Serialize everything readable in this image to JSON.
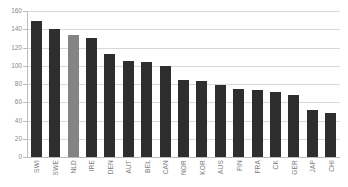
{
  "chart_data": {
    "type": "bar",
    "title": "",
    "xlabel": "",
    "ylabel": "",
    "ylim": [
      0,
      160
    ],
    "ytick_step": 20,
    "yticks": [
      160,
      140,
      120,
      100,
      80,
      60,
      40,
      20,
      0
    ],
    "grid": true,
    "legend": "none",
    "categories": [
      "SWI",
      "SWE",
      "NLD",
      "IRE",
      "DEN",
      "AUT",
      "BEL",
      "CAN",
      "NOR",
      "KOR",
      "AUS",
      "FIN",
      "FRA",
      "CK",
      "GER",
      "JAP",
      "CHI"
    ],
    "values": [
      149,
      140,
      134,
      130,
      113,
      105,
      104,
      100,
      84,
      83,
      79,
      75,
      73,
      71,
      68,
      51,
      48
    ],
    "highlight_index": 2,
    "colors": {
      "bar": "#2e2e2e",
      "bar_highlight": "#848484",
      "grid": "#d9d9d9",
      "axis": "#bdbdbd",
      "tick_text": "#8a8a8a",
      "category_text": "#7d7d7d",
      "background": "#ffffff"
    }
  }
}
